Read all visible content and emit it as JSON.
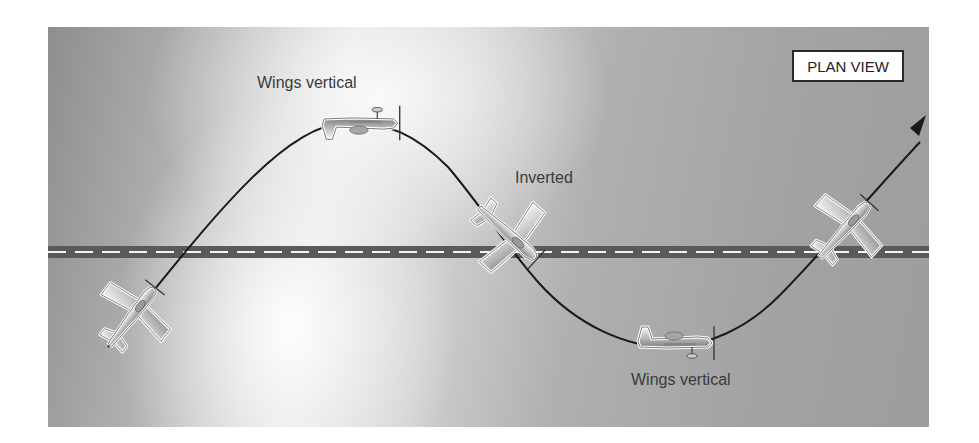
{
  "figure": {
    "view_label": "PLAN VIEW",
    "labels": {
      "top_plane": "Wings vertical",
      "middle_plane": "Inverted",
      "bottom_plane": "Wings vertical"
    },
    "colors": {
      "path": "#1a1a1a",
      "runway": "#555555",
      "runway_dash": "#ffffff",
      "plane_fill": "#d8d8d8",
      "plane_outline": "#ffffff"
    },
    "maneuver_positions": [
      {
        "name": "entry",
        "attitude": "climbing turn",
        "x": 140,
        "y": 307
      },
      {
        "name": "apex-top",
        "attitude": "Wings vertical",
        "x": 360,
        "y": 123
      },
      {
        "name": "crossing",
        "attitude": "Inverted",
        "x": 515,
        "y": 237
      },
      {
        "name": "apex-bottom",
        "attitude": "Wings vertical",
        "x": 680,
        "y": 343
      },
      {
        "name": "exit",
        "attitude": "climbing",
        "x": 855,
        "y": 225
      }
    ]
  }
}
